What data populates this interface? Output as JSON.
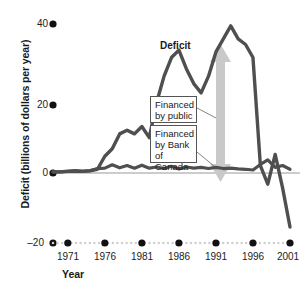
{
  "chart_data": {
    "type": "line",
    "title": "",
    "xlabel": "Year",
    "ylabel": "Deficit (billions of dollars per year)",
    "xlim": [
      1969,
      2002
    ],
    "ylim": [
      -20,
      44
    ],
    "xticks": [
      1971,
      1976,
      1981,
      1986,
      1991,
      1996,
      2001
    ],
    "yticks": [
      -20,
      0,
      20,
      40
    ],
    "grid": false,
    "legend_position": "inline-annotations",
    "annotations": [
      {
        "name": "deficit-label",
        "text": "Deficit",
        "x": 1987,
        "y": 38
      },
      {
        "name": "financed-by-public-callout",
        "text": "Financed by public",
        "x": 1989,
        "y": 18
      },
      {
        "name": "financed-by-bank-of-canada-callout",
        "text": "Financed by Bank of Canada",
        "x": 1989,
        "y": 10
      },
      {
        "name": "range-arrow",
        "text": "",
        "x": 1993,
        "y": 17
      }
    ],
    "series": [
      {
        "name": "Deficit",
        "color": "#4f4f4f",
        "x": [
          1969,
          1970,
          1971,
          1972,
          1973,
          1974,
          1975,
          1976,
          1977,
          1978,
          1979,
          1980,
          1981,
          1982,
          1983,
          1984,
          1985,
          1986,
          1987,
          1988,
          1989,
          1990,
          1991,
          1992,
          1993,
          1994,
          1995,
          1996,
          1997,
          1998,
          1999,
          2000,
          2001
        ],
        "values": [
          0.3,
          0.3,
          0.5,
          0.6,
          0.5,
          0.6,
          1.0,
          4.5,
          6.5,
          10.5,
          11.5,
          10.5,
          12.5,
          9.5,
          19.0,
          26.0,
          31.0,
          33.0,
          28.0,
          24.0,
          21.5,
          26.0,
          32.5,
          36.0,
          39.5,
          36.0,
          34.5,
          31.0,
          2.0,
          -3.0,
          5.0,
          -4.0,
          -14.5
        ]
      },
      {
        "name": "Financed by Bank of Canada",
        "color": "#4f4f4f",
        "x": [
          1969,
          1970,
          1971,
          1972,
          1973,
          1974,
          1975,
          1976,
          1977,
          1978,
          1979,
          1980,
          1981,
          1982,
          1983,
          1984,
          1985,
          1986,
          1987,
          1988,
          1989,
          1990,
          1991,
          1992,
          1993,
          1994,
          1995,
          1996,
          1997,
          1998,
          1999,
          2000,
          2001
        ],
        "values": [
          0.3,
          0.3,
          0.4,
          0.5,
          0.4,
          0.6,
          1.2,
          1.3,
          2.2,
          1.4,
          2.0,
          1.3,
          2.1,
          1.3,
          1.6,
          1.2,
          1.8,
          1.1,
          1.6,
          1.3,
          1.5,
          1.2,
          1.5,
          1.2,
          1.3,
          1.1,
          1.0,
          0.8,
          2.3,
          3.5,
          1.5,
          2.0,
          1.0
        ]
      }
    ]
  },
  "axes": {
    "y_tick_labels": [
      "40",
      "20",
      "0",
      "–20"
    ],
    "x_tick_labels": [
      "1971",
      "1976",
      "1981",
      "1986",
      "1991",
      "1996",
      "2001"
    ],
    "y_axis_title": "Deficit (billions of dollars per year)",
    "x_axis_title": "Year"
  },
  "labels": {
    "deficit": "Deficit",
    "financed_by_public_line1": "Financed",
    "financed_by_public_line2": "by public",
    "financed_by_boc_line1": "Financed",
    "financed_by_boc_line2": "by Bank of",
    "financed_by_boc_line3": "Canada"
  },
  "colors": {
    "curve": "#4f4f4f",
    "arrow": "#c9c9c9",
    "axis_dot": "#111111",
    "grid_dot": "#cfcfcf",
    "zero_line": "#9a9a9a",
    "callout_border": "#555555",
    "text": "#1a1a1a"
  }
}
